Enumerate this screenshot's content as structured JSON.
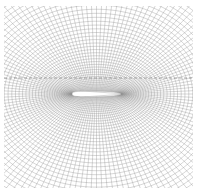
{
  "figure": {
    "type": "computational-mesh",
    "mesh": {
      "left": 4,
      "top": 6,
      "right": 193,
      "bottom": 188,
      "line_color": "#8a8a8a",
      "radial_lines": 140,
      "rings": 46
    },
    "airfoil": {
      "leading_edge_x": 72,
      "trailing_edge_x": 121,
      "center_y": 94,
      "thickness": 5,
      "fill": "#ffffff"
    },
    "wake_line_y": 78
  }
}
